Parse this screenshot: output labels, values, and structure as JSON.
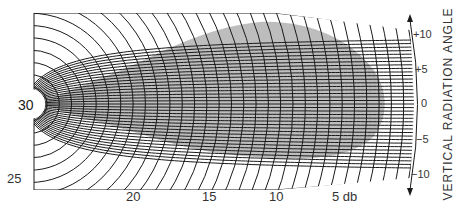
{
  "diagram": {
    "type": "antenna vertical radiation pattern chart",
    "center_label": "30",
    "db_scale": {
      "labels": [
        {
          "text": "25",
          "x": 7,
          "y": 172
        },
        {
          "text": "20",
          "x": 126,
          "y": 190
        },
        {
          "text": "15",
          "x": 202,
          "y": 190
        },
        {
          "text": "10",
          "x": 269,
          "y": 190
        },
        {
          "text": "5 db",
          "x": 332,
          "y": 190
        }
      ]
    },
    "angle_scale": {
      "title": "VERTICAL RADIATION ANGLE",
      "labels": [
        {
          "text": "+10",
          "x": 413,
          "y": 29
        },
        {
          "text": "+5",
          "x": 415,
          "y": 64
        },
        {
          "text": "0",
          "x": 421,
          "y": 98
        },
        {
          "text": "−5",
          "x": 416,
          "y": 134
        },
        {
          "text": "−10",
          "x": 411,
          "y": 169
        }
      ]
    },
    "colors": {
      "grid": "#1a1a1a",
      "lobe_fill": "#bdbdbd",
      "background": "#ffffff"
    }
  }
}
